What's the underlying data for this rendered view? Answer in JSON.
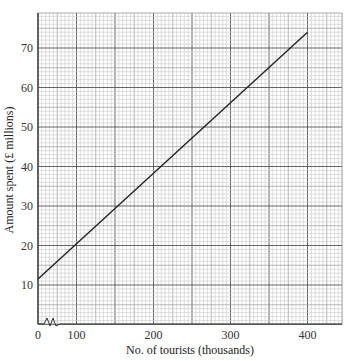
{
  "chart_data": {
    "type": "line",
    "title": "",
    "xlabel": "No. of tourists (thousands)",
    "ylabel": "Amount spent (£ millions)",
    "x_ticks": [
      "0",
      "100",
      "200",
      "300",
      "400"
    ],
    "y_ticks": [
      "10",
      "20",
      "30",
      "40",
      "50",
      "60",
      "70"
    ],
    "xlim": [
      50,
      440
    ],
    "ylim": [
      2,
      80
    ],
    "x_axis_break": true,
    "grid": true,
    "series": [
      {
        "name": "Amount spent",
        "x": [
          50,
          400
        ],
        "y": [
          11.5,
          74
        ]
      }
    ]
  },
  "colors": {
    "line": "#222222",
    "grid_minor": "#c8c8c8",
    "grid_medium": "#9a9a9a",
    "grid_major": "#555555",
    "axis": "#333333"
  }
}
